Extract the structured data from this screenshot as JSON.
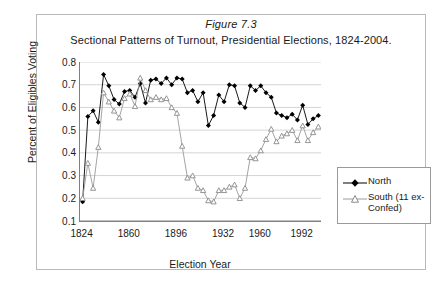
{
  "figure": {
    "title_line1": "Figure 7.3",
    "title_line2": "Sectional Patterns of Turnout, Presidential Elections, 1824-2004."
  },
  "axes": {
    "ylabel": "Percent of Eligibles Voting",
    "xlabel": "Election Year",
    "ytick_labels": [
      "0.8",
      "0.7",
      "0.6",
      "0.5",
      "0.4",
      "0.3",
      "0.2",
      "0.1"
    ],
    "xtick_labels": [
      "1824",
      "1860",
      "1896",
      "1932",
      "1960",
      "1992"
    ]
  },
  "legend": {
    "north_label": "North",
    "south_label": "South (11 ex-Confed)"
  },
  "colors": {
    "north": "#000000",
    "south": "#9a9a9a",
    "grid": "#d4d4d4",
    "axis": "#808080",
    "frame": "#b9b9b9",
    "text": "#1a1a1a",
    "background": "#ffffff"
  },
  "chart_data": {
    "type": "line",
    "title": "Sectional Patterns of Turnout, Presidential Elections, 1824-2004.",
    "xlabel": "Election Year",
    "ylabel": "Percent of Eligibles Voting",
    "ylim": [
      0.1,
      0.8
    ],
    "ytick_step": 0.1,
    "grid": true,
    "legend_position": "right",
    "x": [
      1824,
      1828,
      1832,
      1836,
      1840,
      1844,
      1848,
      1852,
      1856,
      1860,
      1864,
      1868,
      1872,
      1876,
      1880,
      1884,
      1888,
      1892,
      1896,
      1900,
      1904,
      1908,
      1912,
      1916,
      1920,
      1924,
      1928,
      1932,
      1936,
      1940,
      1944,
      1948,
      1952,
      1956,
      1960,
      1964,
      1968,
      1972,
      1976,
      1980,
      1984,
      1988,
      1992,
      1996,
      2000,
      2004
    ],
    "xtick_labeled": [
      1824,
      1860,
      1896,
      1932,
      1960,
      1992
    ],
    "series": [
      {
        "name": "North",
        "marker": "filled-diamond",
        "color": "#000000",
        "values": [
          0.185,
          0.56,
          0.585,
          0.535,
          0.745,
          0.695,
          0.635,
          0.615,
          0.67,
          0.675,
          0.645,
          0.705,
          0.62,
          0.72,
          0.725,
          0.705,
          0.73,
          0.7,
          0.73,
          0.725,
          0.665,
          0.675,
          0.625,
          0.665,
          0.52,
          0.565,
          0.655,
          0.625,
          0.7,
          0.695,
          0.62,
          0.6,
          0.695,
          0.675,
          0.695,
          0.665,
          0.645,
          0.575,
          0.565,
          0.555,
          0.57,
          0.545,
          0.61,
          0.525,
          0.55,
          0.565
        ]
      },
      {
        "name": "South (11 ex-Confed)",
        "marker": "open-triangle",
        "color": "#9a9a9a",
        "values": [
          0.2,
          0.355,
          0.245,
          0.425,
          0.665,
          0.625,
          0.585,
          0.555,
          0.64,
          0.66,
          0.605,
          0.73,
          0.675,
          0.635,
          0.645,
          0.635,
          0.64,
          0.6,
          0.575,
          0.43,
          0.29,
          0.3,
          0.245,
          0.235,
          0.19,
          0.185,
          0.235,
          0.235,
          0.25,
          0.26,
          0.2,
          0.245,
          0.38,
          0.375,
          0.41,
          0.46,
          0.505,
          0.45,
          0.475,
          0.485,
          0.5,
          0.455,
          0.52,
          0.455,
          0.49,
          0.515
        ]
      }
    ]
  }
}
